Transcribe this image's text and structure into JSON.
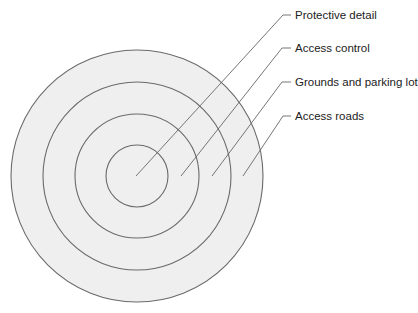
{
  "diagram": {
    "type": "concentric-rings",
    "center": {
      "x": 137,
      "y": 176
    },
    "ring_radii": [
      126,
      94,
      62,
      31
    ],
    "fill_color": "#efefef",
    "stroke_color": "#6a6a6a",
    "leader_color": "#666666",
    "labels": [
      {
        "text": "Protective detail",
        "ring": 1,
        "anchor": {
          "x": 136,
          "y": 176
        },
        "elbow": {
          "x": 283,
          "y": 15
        },
        "label_pos": {
          "x": 295,
          "y": 8
        }
      },
      {
        "text": "Access control",
        "ring": 2,
        "anchor": {
          "x": 181,
          "y": 176
        },
        "elbow": {
          "x": 282,
          "y": 48
        },
        "label_pos": {
          "x": 295,
          "y": 41
        }
      },
      {
        "text": "Grounds and parking lot",
        "ring": 3,
        "anchor": {
          "x": 212,
          "y": 176
        },
        "elbow": {
          "x": 282,
          "y": 82
        },
        "label_pos": {
          "x": 295,
          "y": 75
        }
      },
      {
        "text": "Access roads",
        "ring": 4,
        "anchor": {
          "x": 243,
          "y": 176
        },
        "elbow": {
          "x": 283,
          "y": 116
        },
        "label_pos": {
          "x": 295,
          "y": 109
        }
      }
    ]
  }
}
